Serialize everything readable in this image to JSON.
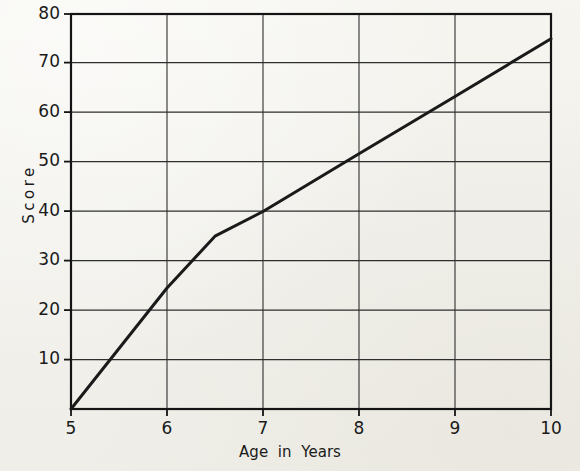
{
  "chart_data": {
    "type": "line",
    "title": "",
    "xlabel": "Age in Years",
    "ylabel": "Score",
    "xlim": [
      5,
      10
    ],
    "ylim": [
      0,
      80
    ],
    "xticks": [
      "5",
      "6",
      "7",
      "8",
      "9",
      "10"
    ],
    "xtick_values": [
      5,
      6,
      7,
      8,
      9,
      10
    ],
    "yticks": [
      "10",
      "20",
      "30",
      "40",
      "50",
      "60",
      "70",
      "80"
    ],
    "ytick_values": [
      10,
      20,
      30,
      40,
      50,
      60,
      70,
      80
    ],
    "grid": true,
    "legend": null,
    "series": [
      {
        "name": "Score by age",
        "x": [
          5,
          6,
          6.5,
          7,
          8,
          9,
          10
        ],
        "values": [
          0,
          24.5,
          35,
          40,
          51.7,
          63.3,
          75
        ]
      }
    ],
    "annotations": [],
    "colors": {
      "line": "#1a1a1a",
      "grid": "#2b2b2b",
      "axis": "#111111",
      "background": "#f4f3ee",
      "text": "#1a1a1a"
    }
  },
  "axis": {
    "y_label_text": "Score",
    "x_label_text": "Age in Years"
  }
}
